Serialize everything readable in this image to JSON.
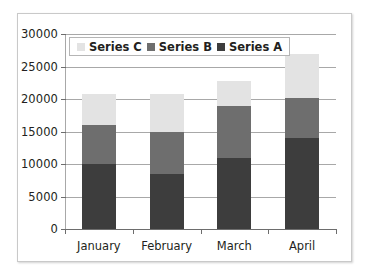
{
  "chart_data": {
    "type": "bar",
    "subtype": "stacked-bar",
    "title": "",
    "xlabel": "",
    "ylabel": "",
    "categories": [
      "January",
      "February",
      "March",
      "April"
    ],
    "series": [
      {
        "name": "Series A",
        "color": "#3d3d3d",
        "values": [
          10000,
          8500,
          11000,
          14000
        ]
      },
      {
        "name": "Series B",
        "color": "#6e6e6e",
        "values": [
          6000,
          6500,
          8000,
          6200
        ]
      },
      {
        "name": "Series C",
        "color": "#e3e3e3",
        "values": [
          4700,
          5700,
          3800,
          6800
        ]
      }
    ],
    "stack_totals": [
      20700,
      20700,
      22800,
      27000
    ],
    "ylim": [
      0,
      30000
    ],
    "ytick_values": [
      0,
      5000,
      10000,
      15000,
      20000,
      25000,
      30000
    ],
    "ytick_labels": [
      "0",
      "5000",
      "10000",
      "15000",
      "20000",
      "25000",
      "30000"
    ],
    "grid": true,
    "legend_position": "top-left-inside",
    "legend_order": [
      "Series C",
      "Series B",
      "Series A"
    ]
  },
  "legend": {
    "items": [
      {
        "label": "Series C",
        "color": "#e3e3e3"
      },
      {
        "label": "Series B",
        "color": "#6e6e6e"
      },
      {
        "label": "Series A",
        "color": "#3d3d3d"
      }
    ]
  },
  "colors": {
    "series_a": "#3d3d3d",
    "series_b": "#6e6e6e",
    "series_c": "#e3e3e3",
    "gridline": "#a8a8a8",
    "axis": "#6d6d6d",
    "frame_border": "#c9c9c9",
    "text": "#231f20",
    "background": "#ffffff"
  }
}
